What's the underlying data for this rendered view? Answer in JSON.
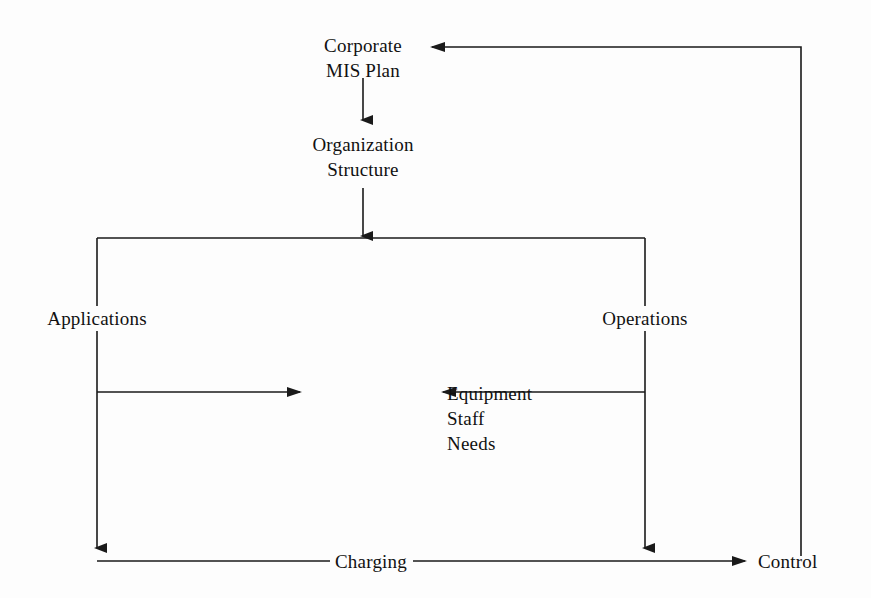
{
  "figure": {
    "type": "flow-diagram",
    "title": "",
    "background_color": "#fdfdfd",
    "line_color": "#1a1a1a",
    "text_color": "#111111"
  },
  "nodes": [
    {
      "id": "corporate-mis-plan",
      "lines": [
        "Corporate",
        "MIS Plan"
      ],
      "x": 363,
      "y": 36,
      "align": "center"
    },
    {
      "id": "organization-structure",
      "lines": [
        "Organization",
        "Structure"
      ],
      "x": 363,
      "y": 135,
      "align": "center"
    },
    {
      "id": "applications",
      "lines": [
        "Applications"
      ],
      "x": 97,
      "y": 309,
      "align": "center"
    },
    {
      "id": "operations",
      "lines": [
        "Operations"
      ],
      "x": 645,
      "y": 309,
      "align": "center"
    },
    {
      "id": "equipment-staff-needs",
      "lines": [
        "Equipment",
        "Staff",
        "Needs"
      ],
      "x": 447,
      "y": 382,
      "align": "left"
    },
    {
      "id": "charging",
      "lines": [
        "Charging"
      ],
      "x": 330,
      "y": 550,
      "align": "left"
    },
    {
      "id": "control",
      "lines": [
        "Control"
      ],
      "x": 760,
      "y": 550,
      "align": "left"
    }
  ],
  "edges": [
    {
      "id": "control-to-corporate",
      "from": "control",
      "to": "corporate-mis-plan",
      "arrow": "left",
      "path": "feedback loop up right side and left into Corporate MIS Plan"
    },
    {
      "id": "corporate-to-organization",
      "from": "corporate-mis-plan",
      "to": "organization-structure",
      "arrow": "down"
    },
    {
      "id": "organization-to-split",
      "from": "organization-structure",
      "to": "applications-operations-bus",
      "arrow": "down"
    },
    {
      "id": "bus-to-applications",
      "from": "applications-operations-bus",
      "to": "applications",
      "arrow": "none"
    },
    {
      "id": "bus-to-operations",
      "from": "applications-operations-bus",
      "to": "operations",
      "arrow": "none"
    },
    {
      "id": "applications-to-equipment",
      "from": "applications",
      "to": "equipment-staff-needs",
      "arrow": "right"
    },
    {
      "id": "operations-to-equipment",
      "from": "operations",
      "to": "equipment-staff-needs",
      "arrow": "left"
    },
    {
      "id": "applications-to-bottom",
      "from": "applications",
      "to": "charging-bus",
      "arrow": "down"
    },
    {
      "id": "operations-to-bottom",
      "from": "operations",
      "to": "charging-bus",
      "arrow": "down"
    },
    {
      "id": "charging-to-control",
      "from": "charging-bus",
      "to": "control",
      "arrow": "right"
    }
  ]
}
